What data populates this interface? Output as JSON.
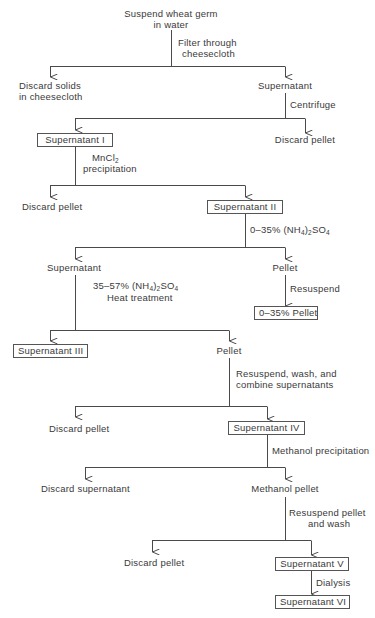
{
  "diagram": {
    "type": "flowchart",
    "colors": {
      "line": "#4a4a4a",
      "text": "#3a3a3a",
      "background": "#ffffff"
    },
    "nodes": {
      "start": {
        "line1": "Suspend wheat germ",
        "line2": "in water"
      },
      "discard_solids": {
        "line1": "Discard solids",
        "line2": "in cheesecloth"
      },
      "supernatant_0": "Supernatant",
      "discard_pellet_1": "Discard pellet",
      "supernatant_I": "Supernatant I",
      "discard_pellet_2": "Discard pellet",
      "supernatant_II": "Supernatant II",
      "supernatant_a": "Supernatant",
      "pellet_a": "Pellet",
      "pellet_0_35": "0–35% Pellet",
      "supernatant_III": "Supernatant III",
      "pellet_b": "Pellet",
      "discard_pellet_3": "Discard pellet",
      "supernatant_IV": "Supernatant IV",
      "discard_supernatant": "Discard supernatant",
      "methanol_pellet": "Methanol pellet",
      "discard_pellet_4": "Discard pellet",
      "supernatant_V": "Supernatant V",
      "supernatant_VI": "Supernatant VI"
    },
    "steps": {
      "filter": {
        "line1": "Filter through",
        "line2": "cheesecloth"
      },
      "centrifuge": "Centrifuge",
      "mncl2": {
        "prefix": "MnCl",
        "sub": "2",
        "line2": "precipitation"
      },
      "ammonium_0_35": {
        "prefix": "0–35% (NH",
        "sub1": "4",
        "mid": ")",
        "sub2": "2",
        "suffix": "SO",
        "sub3": "4"
      },
      "resuspend": "Resuspend",
      "ammonium_35_57": {
        "prefix": "35–57% (NH",
        "sub1": "4",
        "mid": ")",
        "sub2": "2",
        "suffix": "SO",
        "sub3": "4",
        "line2": "Heat treatment"
      },
      "resuspend_combine": {
        "line1": "Resuspend, wash, and",
        "line2": "combine supernatants"
      },
      "methanol_precip": "Methanol precipitation",
      "resuspend_wash": {
        "line1": "Resuspend pellet",
        "line2": "and wash"
      },
      "dialysis": "Dialysis"
    }
  }
}
